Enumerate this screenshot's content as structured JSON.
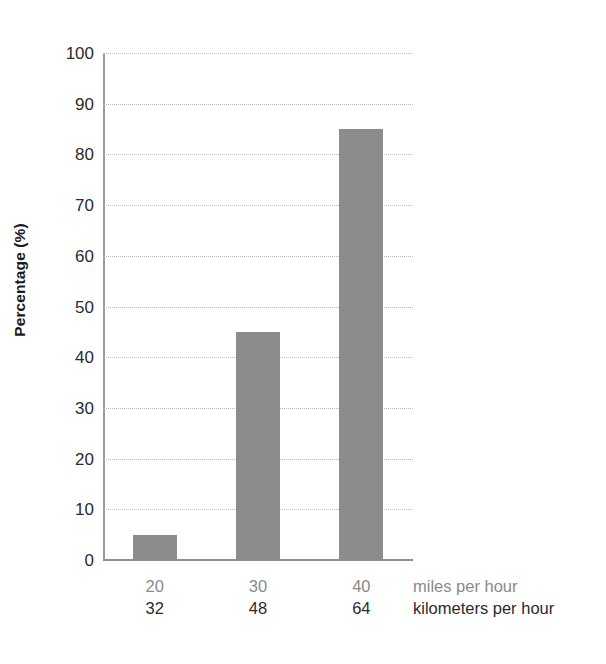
{
  "chart_data": {
    "type": "bar",
    "title": "",
    "subtitle": "",
    "xlabel": "",
    "ylabel": "Percentage (%)",
    "categories": [
      "20",
      "30",
      "40"
    ],
    "categories_secondary": [
      "32",
      "48",
      "64"
    ],
    "values": [
      5,
      45,
      85
    ],
    "ylim": [
      0,
      100
    ],
    "ytick_labels": [
      "100",
      "90",
      "80",
      "70",
      "60",
      "50",
      "40",
      "30",
      "20",
      "10",
      "0"
    ],
    "ytick_values": [
      100,
      90,
      80,
      70,
      60,
      50,
      40,
      30,
      20,
      10,
      0
    ],
    "grid": true,
    "grid_axis": "y",
    "legend": "none",
    "bar_color": "#8c8c8c",
    "grid_color": "#b9b9b9",
    "axis_color": "#8f8f8f",
    "series": [
      {
        "name": "Percentage",
        "values": [
          5,
          45,
          85
        ]
      }
    ],
    "unit_row_primary": "miles per hour",
    "unit_row_secondary": "kilometers per hour"
  },
  "axes": {
    "y_title": "Percentage (%)",
    "x_unit_primary": "miles per hour",
    "x_unit_secondary": "kilometers per hour"
  }
}
